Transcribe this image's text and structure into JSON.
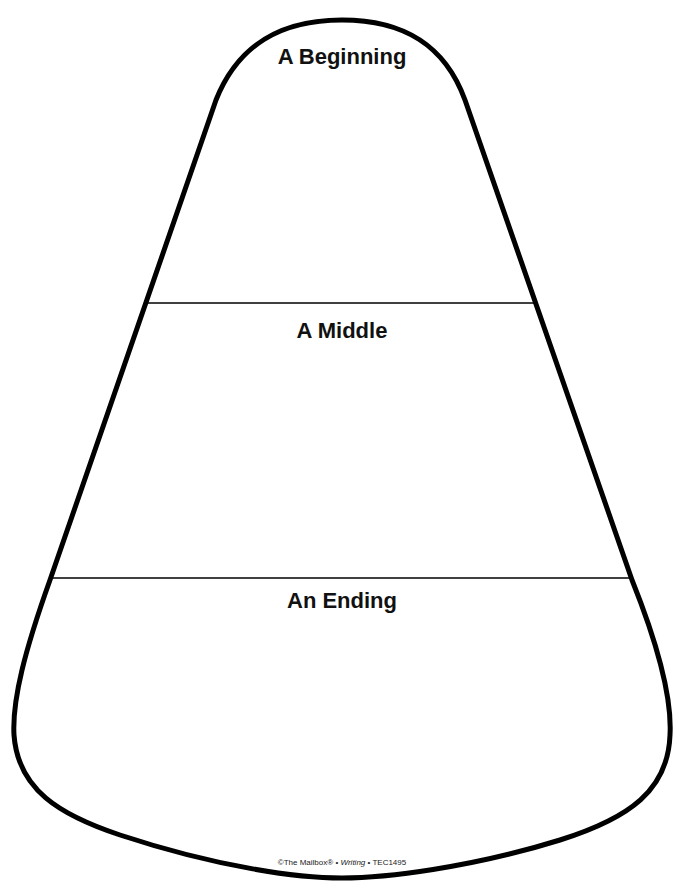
{
  "worksheet": {
    "shape": "candy-corn",
    "sections": [
      {
        "label": "A Beginning"
      },
      {
        "label": "A Middle"
      },
      {
        "label": "An Ending"
      }
    ],
    "credit": {
      "publisher": "©The Mailbox®",
      "separator": " • ",
      "subject": "Writing",
      "code": "TEC1495"
    },
    "colors": {
      "outline": "#000000",
      "background": "#ffffff",
      "text": "#111111"
    }
  }
}
